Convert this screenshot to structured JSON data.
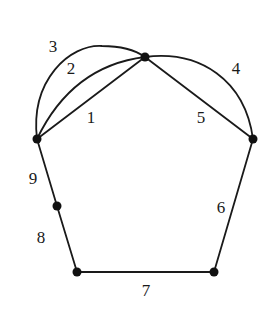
{
  "diagram": {
    "type": "multigraph",
    "colors": {
      "stroke": "#1a1a1a",
      "node": "#111111",
      "background": "#ffffff"
    },
    "nodes": [
      {
        "id": "top",
        "x": 145,
        "y": 57
      },
      {
        "id": "left",
        "x": 37,
        "y": 139
      },
      {
        "id": "right",
        "x": 253,
        "y": 139
      },
      {
        "id": "mid_left",
        "x": 57,
        "y": 206
      },
      {
        "id": "bottom_left",
        "x": 77,
        "y": 272
      },
      {
        "id": "bottom_right",
        "x": 214,
        "y": 272
      }
    ],
    "edges": [
      {
        "label": "1",
        "from": "left",
        "to": "top",
        "shape": "straight",
        "label_x": 91,
        "label_y": 119
      },
      {
        "label": "2",
        "from": "left",
        "to": "top",
        "shape": "arc",
        "label_x": 71,
        "label_y": 70
      },
      {
        "label": "3",
        "from": "left",
        "to": "top",
        "shape": "arc",
        "label_x": 53,
        "label_y": 48
      },
      {
        "label": "4",
        "from": "top",
        "to": "right",
        "shape": "arc",
        "label_x": 236,
        "label_y": 70
      },
      {
        "label": "5",
        "from": "top",
        "to": "right",
        "shape": "straight",
        "label_x": 201,
        "label_y": 119
      },
      {
        "label": "6",
        "from": "right",
        "to": "bottom_right",
        "shape": "straight",
        "label_x": 221,
        "label_y": 209
      },
      {
        "label": "7",
        "from": "bottom_right",
        "to": "bottom_left",
        "shape": "straight",
        "label_x": 146,
        "label_y": 292
      },
      {
        "label": "8",
        "from": "bottom_left",
        "to": "mid_left",
        "shape": "straight",
        "label_x": 41,
        "label_y": 239
      },
      {
        "label": "9",
        "from": "mid_left",
        "to": "left",
        "shape": "straight",
        "label_x": 33,
        "label_y": 180
      }
    ]
  }
}
